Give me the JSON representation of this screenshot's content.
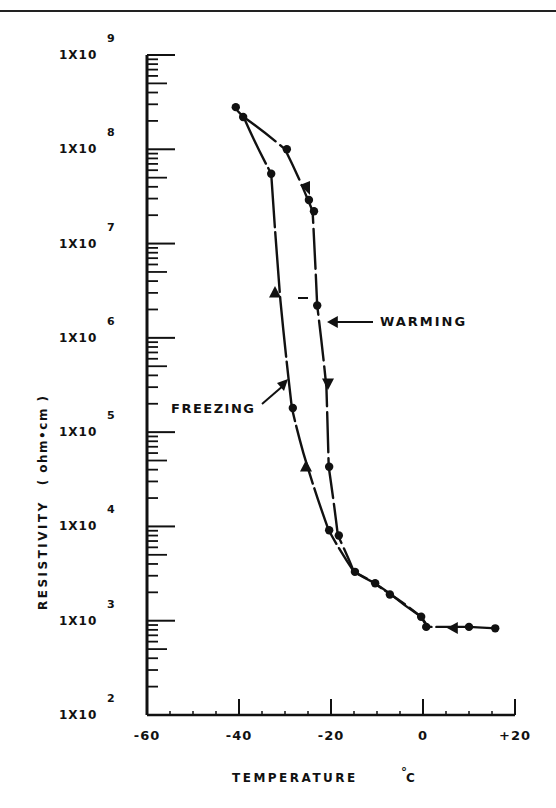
{
  "chart_data": {
    "type": "line",
    "title": "",
    "xlabel": "TEMPERATURE °C",
    "ylabel": "RESISTIVITY ( ohm•cm )",
    "xlim": [
      -60,
      20
    ],
    "ylim": [
      100,
      1000000000
    ],
    "yscale": "log",
    "grid": false,
    "x_ticks": [
      "-60",
      "-40",
      "-20",
      "0",
      "+20"
    ],
    "y_ticks": [
      {
        "base": "1X10",
        "exp": "9"
      },
      {
        "base": "1X10",
        "exp": "8"
      },
      {
        "base": "1X10",
        "exp": "7"
      },
      {
        "base": "1X10",
        "exp": "6"
      },
      {
        "base": "1X10",
        "exp": "5"
      },
      {
        "base": "1X10",
        "exp": "4"
      },
      {
        "base": "1X10",
        "exp": "3"
      },
      {
        "base": "1X10",
        "exp": "2"
      }
    ],
    "annotations": [
      {
        "text": "WARMING",
        "points_to": "warming branch near -21°C, 1.5e6"
      },
      {
        "text": "FREEZING",
        "points_to": "freezing branch near -30°C, 3e5"
      }
    ],
    "series": [
      {
        "name": "FREEZING",
        "x": [
          16,
          10,
          1,
          -0.4,
          -7,
          -10.5,
          -15,
          -20.5,
          -26,
          -28.5,
          -31,
          -33,
          -39,
          -41
        ],
        "y": [
          830,
          860,
          860,
          1100,
          1900,
          2500,
          3300,
          9100,
          60000,
          180000,
          2500000,
          55000000,
          220000000,
          280000000
        ]
      },
      {
        "name": "WARMING",
        "x": [
          -39,
          -30,
          -25,
          -24,
          -23,
          -21,
          -20.5,
          -18.5,
          -15,
          -10.5,
          -7,
          -0.4,
          1
        ],
        "y": [
          220000000,
          100000000,
          29000000,
          22000000,
          2200000,
          300000,
          43000,
          8000,
          3300,
          2500,
          1900,
          1100,
          860
        ]
      }
    ],
    "data_points": [
      {
        "t": -40.7,
        "r": 280000000
      },
      {
        "t": -39.1,
        "r": 220000000
      },
      {
        "t": -29.6,
        "r": 100000000
      },
      {
        "t": -33.0,
        "r": 55000000
      },
      {
        "t": -24.8,
        "r": 29000000
      },
      {
        "t": -23.7,
        "r": 22000000
      },
      {
        "t": -23.0,
        "r": 2200000
      },
      {
        "t": -28.3,
        "r": 180000
      },
      {
        "t": -20.4,
        "r": 43000
      },
      {
        "t": -20.4,
        "r": 9100
      },
      {
        "t": -18.3,
        "r": 8000
      },
      {
        "t": -14.8,
        "r": 3300
      },
      {
        "t": -10.4,
        "r": 2500
      },
      {
        "t": -7.2,
        "r": 1900
      },
      {
        "t": -0.4,
        "r": 1100
      },
      {
        "t": 0.7,
        "r": 860
      },
      {
        "t": 10.0,
        "r": 860
      },
      {
        "t": 15.7,
        "r": 830
      }
    ]
  },
  "labels": {
    "warming": "WARMING",
    "freezing": "FREEZING",
    "xlabel_main": "TEMPERATURE",
    "xlabel_unit": "C",
    "degree": "°",
    "ylabel_main": "RESISTIVITY",
    "ylabel_unit": "( ohm•cm )"
  }
}
